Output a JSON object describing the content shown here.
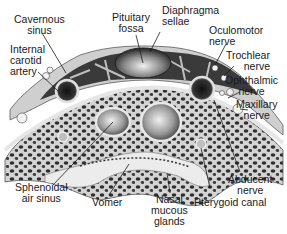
{
  "figure": {
    "colors": {
      "background": "#ffffff",
      "bone": "#d9d9d9",
      "bone_dark": "#4a4a4a",
      "sinus_dark": "#2b2b2b",
      "mucosa": "#e8e8e8",
      "label_text": "#1a1a1a",
      "leader_line": "#1a1a1a"
    }
  },
  "labels": {
    "cavernous_sinus": {
      "line1": "Cavernous",
      "line2": "sinus"
    },
    "pituitary_fossa": {
      "line1": "Pituitary",
      "line2": "fossa"
    },
    "diaphragma_sellae": {
      "line1": "Diaphragma",
      "line2": "sellae"
    },
    "internal_carotid": {
      "line1": "Internal",
      "line2": "carotid",
      "line3": "artery"
    },
    "oculomotor": {
      "line1": "Oculomotor",
      "line2": "nerve"
    },
    "trochlear": {
      "line1": "Trochlear",
      "line2": "nerve"
    },
    "ophthalmic": {
      "line1": "Ophthalmic",
      "line2": "nerve"
    },
    "maxillary": {
      "line1": "Maxillary",
      "line2": "nerve"
    },
    "abducent": {
      "line1": "Abducent",
      "line2": "nerve"
    },
    "sphenoidal": {
      "line1": "Sphenoidal",
      "line2": "air sinus"
    },
    "vomer": {
      "line1": "Vomer"
    },
    "nasal": {
      "line1": "Nasal",
      "line2": "mucous",
      "line3": "glands"
    },
    "pterygoid": {
      "line1": "Pterygoid canal"
    }
  }
}
